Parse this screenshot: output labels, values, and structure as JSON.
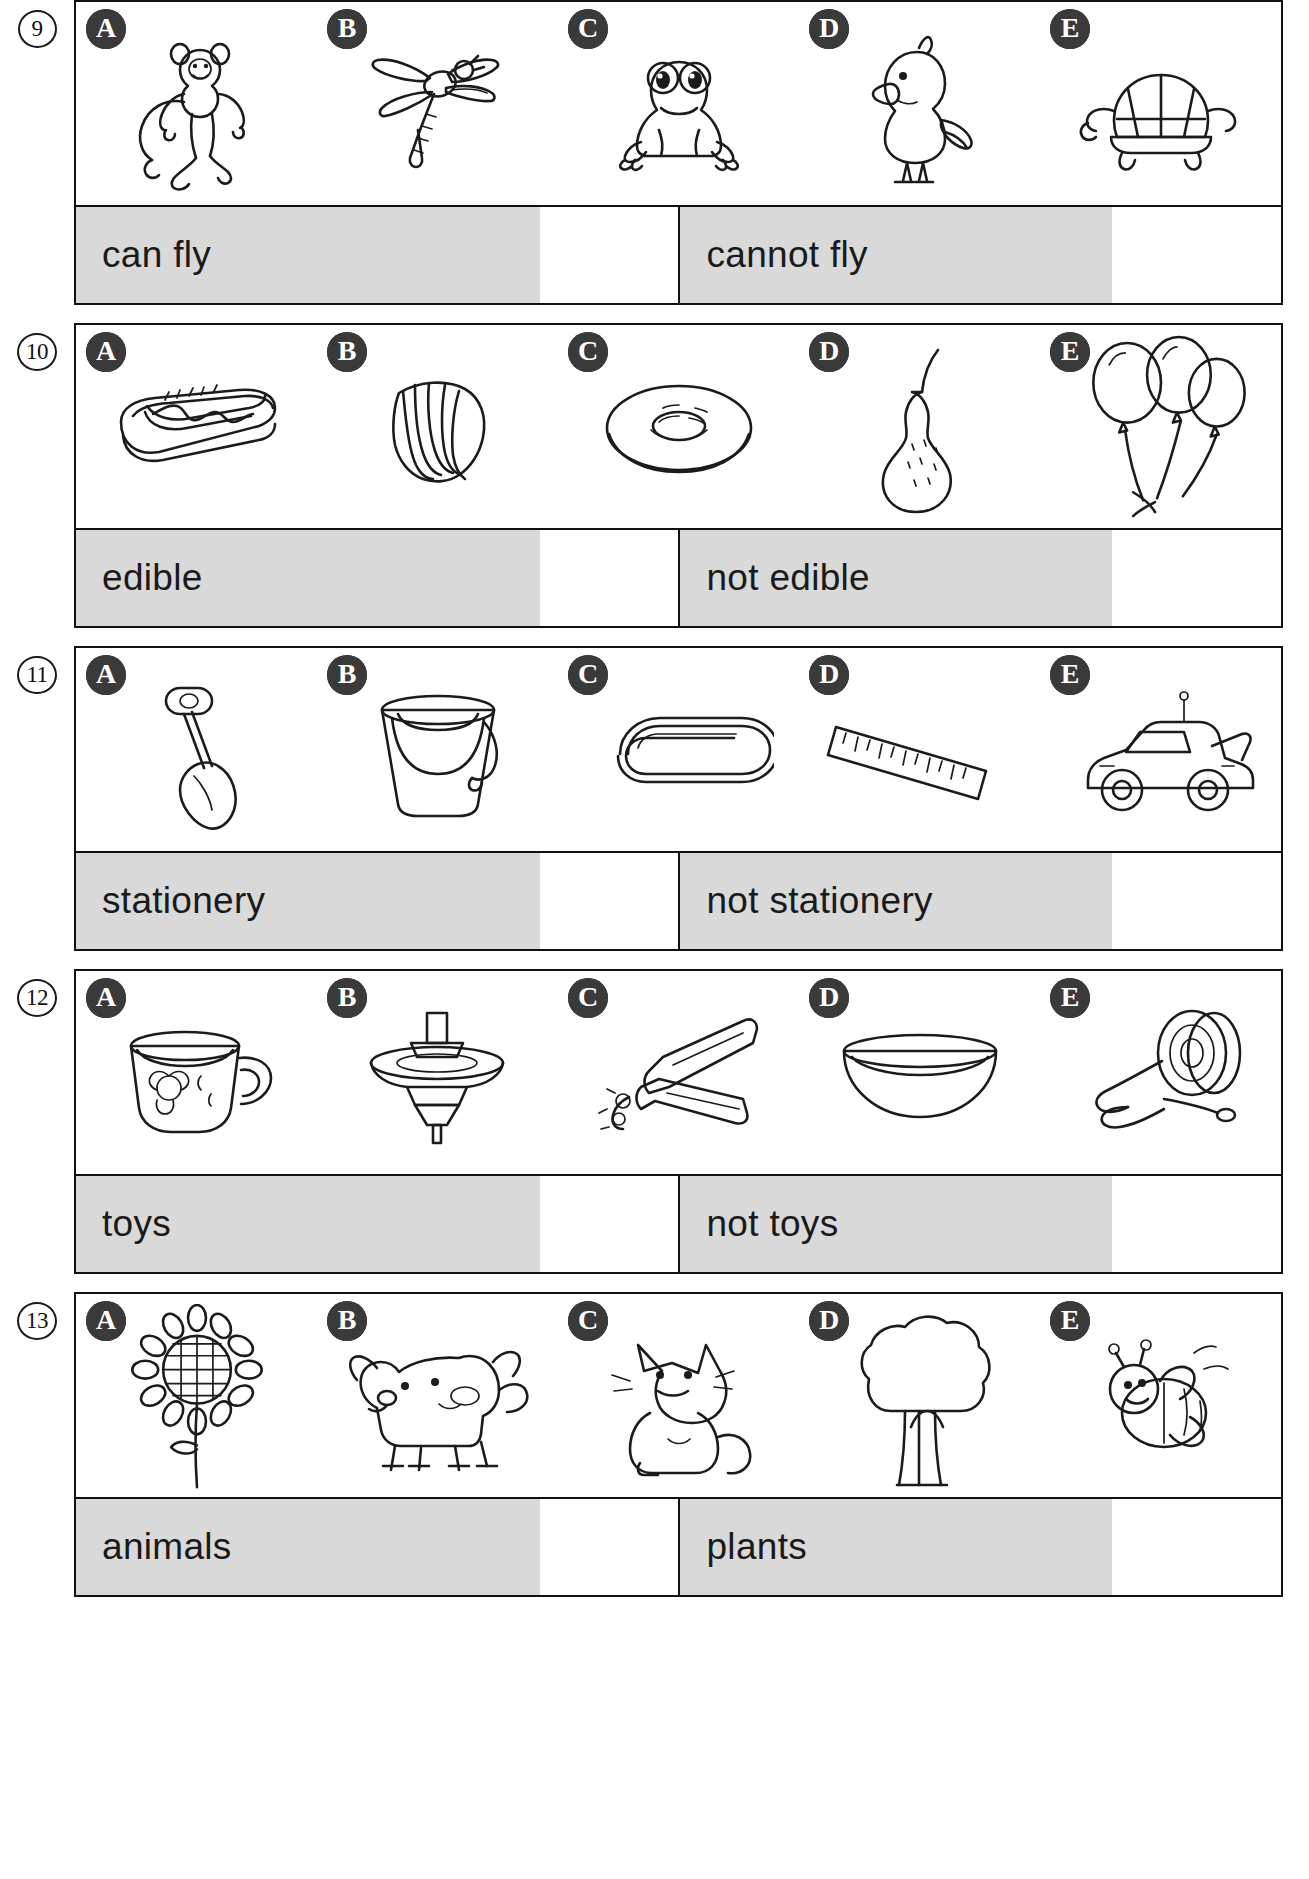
{
  "worksheet": {
    "option_letters": [
      "A",
      "B",
      "C",
      "D",
      "E"
    ],
    "rows": [
      {
        "number": "9",
        "category_a": "can fly",
        "category_b": "cannot fly",
        "items": [
          {
            "letter": "A",
            "name": "monkey"
          },
          {
            "letter": "B",
            "name": "dragonfly"
          },
          {
            "letter": "C",
            "name": "frog"
          },
          {
            "letter": "D",
            "name": "bird"
          },
          {
            "letter": "E",
            "name": "turtle"
          }
        ]
      },
      {
        "number": "10",
        "category_a": "edible",
        "category_b": "not edible",
        "items": [
          {
            "letter": "A",
            "name": "hot-dog"
          },
          {
            "letter": "B",
            "name": "seashell"
          },
          {
            "letter": "C",
            "name": "doughnut"
          },
          {
            "letter": "D",
            "name": "pear"
          },
          {
            "letter": "E",
            "name": "balloons"
          }
        ]
      },
      {
        "number": "11",
        "category_a": "stationery",
        "category_b": "not stationery",
        "items": [
          {
            "letter": "A",
            "name": "spade"
          },
          {
            "letter": "B",
            "name": "bucket"
          },
          {
            "letter": "C",
            "name": "paper-clip"
          },
          {
            "letter": "D",
            "name": "ruler"
          },
          {
            "letter": "E",
            "name": "toy-car"
          }
        ]
      },
      {
        "number": "12",
        "category_a": "toys",
        "category_b": "not toys",
        "items": [
          {
            "letter": "A",
            "name": "teacup"
          },
          {
            "letter": "B",
            "name": "spinning-top"
          },
          {
            "letter": "C",
            "name": "pliers"
          },
          {
            "letter": "D",
            "name": "bowl"
          },
          {
            "letter": "E",
            "name": "yoyo"
          }
        ]
      },
      {
        "number": "13",
        "category_a": "animals",
        "category_b": "plants",
        "items": [
          {
            "letter": "A",
            "name": "sunflower"
          },
          {
            "letter": "B",
            "name": "dog"
          },
          {
            "letter": "C",
            "name": "cat"
          },
          {
            "letter": "D",
            "name": "tree"
          },
          {
            "letter": "E",
            "name": "bee"
          }
        ]
      }
    ]
  },
  "colors": {
    "ink": "#1b1b1b",
    "badge_fill": "#3a3a3a",
    "shaded_cell": "#d9d9d9",
    "page": "#ffffff"
  }
}
